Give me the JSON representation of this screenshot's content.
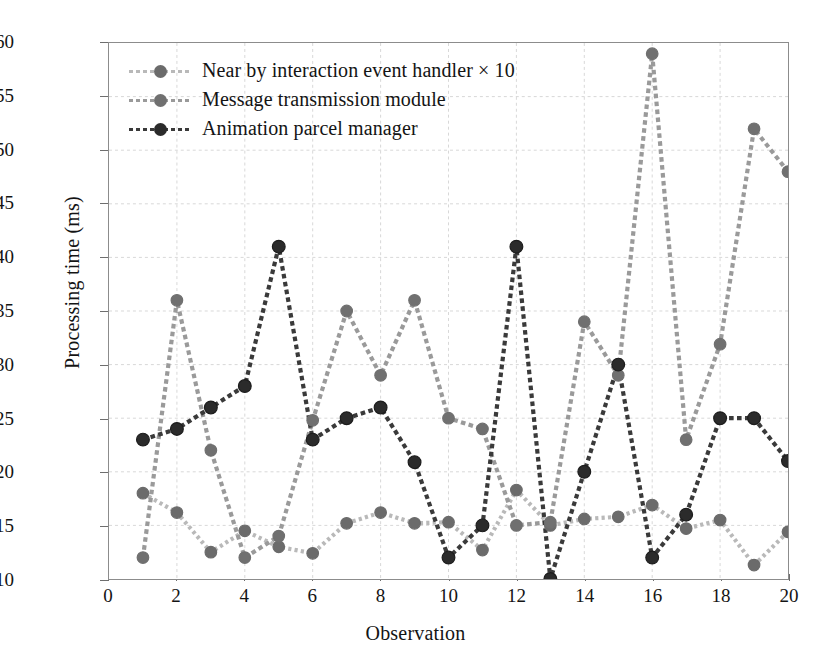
{
  "chart_data": {
    "type": "line",
    "title": "",
    "xlabel": "Observation",
    "ylabel": "Processing time (ms)",
    "xlim": [
      0,
      20
    ],
    "ylim": [
      10,
      60
    ],
    "xticks": [
      0,
      2,
      4,
      6,
      8,
      10,
      12,
      14,
      16,
      18,
      20
    ],
    "yticks": [
      10,
      15,
      20,
      25,
      30,
      35,
      40,
      45,
      50,
      55,
      60
    ],
    "grid": true,
    "legend_position": "top-left",
    "marker": "circle",
    "linestyle": "dotted",
    "x": [
      1,
      2,
      3,
      4,
      5,
      6,
      7,
      8,
      9,
      10,
      11,
      12,
      13,
      14,
      15,
      16,
      17,
      18,
      19,
      20
    ],
    "series": [
      {
        "name": "Near by interaction event handler × 10",
        "color": "#b9b9b9",
        "marker_color": "#6b6b6b",
        "values": [
          18.0,
          16.2,
          12.5,
          14.5,
          13.0,
          12.4,
          15.2,
          16.2,
          15.2,
          15.3,
          12.7,
          18.3,
          15.0,
          15.6,
          15.8,
          16.9,
          14.7,
          15.5,
          11.3,
          14.4
        ]
      },
      {
        "name": "Message transmission module",
        "color": "#9a9a9a",
        "marker_color": "#707070",
        "values": [
          12.0,
          36.0,
          22.0,
          12.0,
          14.0,
          24.8,
          35.0,
          29.0,
          36.0,
          25.0,
          24.0,
          15.0,
          15.3,
          34.0,
          29.0,
          59.0,
          23.0,
          31.9,
          52.0,
          48.0
        ]
      },
      {
        "name": "Animation parcel manager",
        "color": "#3a3a3a",
        "marker_color": "#2b2b2b",
        "values": [
          23.0,
          24.0,
          26.0,
          28.0,
          41.0,
          23.0,
          25.0,
          26.0,
          20.9,
          12.0,
          15.0,
          41.0,
          10.0,
          20.0,
          30.0,
          12.0,
          16.0,
          25.0,
          25.0,
          21.0
        ]
      }
    ]
  }
}
